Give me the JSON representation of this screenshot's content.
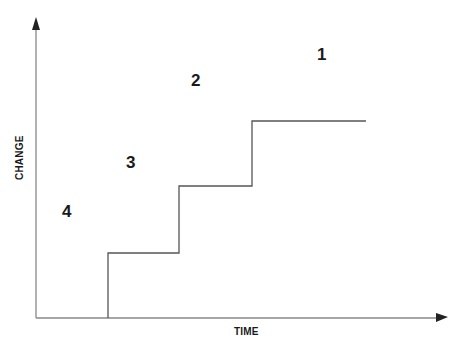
{
  "diagram": {
    "type": "step-chart",
    "axes": {
      "x_label": "TIME",
      "y_label": "CHANGE"
    },
    "colors": {
      "axis": "#888888",
      "arrowhead": "#222222",
      "step_line": "#555555",
      "text": "#1a1a1a"
    },
    "step_path": [
      [
        108,
        318
      ],
      [
        108,
        253
      ],
      [
        179,
        253
      ],
      [
        179,
        186
      ],
      [
        252,
        186
      ],
      [
        252,
        121
      ],
      [
        366,
        121
      ]
    ],
    "region_labels": [
      {
        "id": "1",
        "text": "1",
        "x": 317,
        "y": 45
      },
      {
        "id": "2",
        "text": "2",
        "x": 191,
        "y": 71
      },
      {
        "id": "3",
        "text": "3",
        "x": 126,
        "y": 153
      },
      {
        "id": "4",
        "text": "4",
        "x": 62,
        "y": 202
      }
    ]
  }
}
